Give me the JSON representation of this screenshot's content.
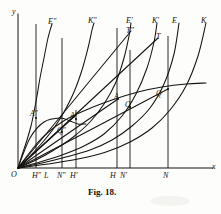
{
  "figure": {
    "caption": "Fig. 18.",
    "axes": {
      "y_label": "y",
      "x_label": "x",
      "origin_label": "O"
    },
    "curve_labels": [
      {
        "text": "E″",
        "x": 48,
        "y": 18
      },
      {
        "text": "K″",
        "x": 88,
        "y": 17
      },
      {
        "text": "E′",
        "x": 126,
        "y": 17
      },
      {
        "text": "T″",
        "x": 126,
        "y": 27
      },
      {
        "text": "K′",
        "x": 152,
        "y": 17
      },
      {
        "text": "E",
        "x": 172,
        "y": 17
      },
      {
        "text": "T",
        "x": 156,
        "y": 33
      },
      {
        "text": "K",
        "x": 201,
        "y": 17
      }
    ],
    "point_labels": [
      {
        "text": "A″",
        "x": 30,
        "y": 110
      },
      {
        "text": "Q″",
        "x": 57,
        "y": 127
      },
      {
        "text": "A′",
        "x": 70,
        "y": 112
      },
      {
        "text": "A",
        "x": 114,
        "y": 93
      },
      {
        "text": "Q′",
        "x": 125,
        "y": 101
      },
      {
        "text": "Q",
        "x": 156,
        "y": 90
      }
    ],
    "foot_labels": [
      {
        "text": "H″",
        "x": 32,
        "y": 172
      },
      {
        "text": "L",
        "x": 44,
        "y": 172
      },
      {
        "text": "N″",
        "x": 57,
        "y": 172
      },
      {
        "text": "H′",
        "x": 70,
        "y": 172
      },
      {
        "text": "H",
        "x": 110,
        "y": 172
      },
      {
        "text": "N′",
        "x": 120,
        "y": 172
      },
      {
        "text": "N",
        "x": 163,
        "y": 172
      }
    ],
    "colors": {
      "ink": "#15130f",
      "paper": "#fdfdfb"
    }
  },
  "chart_data": {
    "type": "line",
    "title": "Fig. 18.",
    "xlabel": "x",
    "ylabel": "y",
    "grid": false,
    "legend": "inline-curve-labels",
    "axis_origin_label": "O",
    "xlim": [
      0,
      221
    ],
    "ylim": [
      0,
      170
    ],
    "axes_geometry": {
      "origin": [
        18,
        168
      ],
      "x_axis_end": [
        213,
        168
      ],
      "y_axis_top": [
        18,
        14
      ]
    },
    "ordinates": [
      {
        "name": "H″",
        "x": 36,
        "y_top": 24
      },
      {
        "name": "N″",
        "x": 62,
        "y_top": 38
      },
      {
        "name": "H′",
        "x": 76,
        "y_top": 110
      },
      {
        "name": "H",
        "x": 117,
        "y_top": 28
      },
      {
        "name": "N′",
        "x": 130,
        "y_top": 50
      },
      {
        "name": "N",
        "x": 168,
        "y_top": 36
      }
    ],
    "series": [
      {
        "name": "E″",
        "kind": "total-curve",
        "points": [
          [
            18,
            168
          ],
          [
            22,
            155
          ],
          [
            27,
            140
          ],
          [
            31,
            126
          ],
          [
            34,
            112
          ],
          [
            37,
            96
          ],
          [
            40,
            78
          ],
          [
            44,
            58
          ],
          [
            48,
            38
          ],
          [
            52,
            24
          ]
        ]
      },
      {
        "name": "K″",
        "kind": "total-curve",
        "points": [
          [
            18,
            168
          ],
          [
            30,
            156
          ],
          [
            42,
            143
          ],
          [
            54,
            128
          ],
          [
            64,
            112
          ],
          [
            74,
            92
          ],
          [
            82,
            70
          ],
          [
            88,
            48
          ],
          [
            92,
            30
          ],
          [
            94,
            23
          ]
        ]
      },
      {
        "name": "E′",
        "kind": "total-curve",
        "points": [
          [
            18,
            168
          ],
          [
            36,
            160
          ],
          [
            54,
            150
          ],
          [
            72,
            138
          ],
          [
            90,
            122
          ],
          [
            104,
            104
          ],
          [
            116,
            82
          ],
          [
            124,
            58
          ],
          [
            129,
            36
          ],
          [
            131,
            23
          ]
        ]
      },
      {
        "name": "K′",
        "kind": "total-curve",
        "points": [
          [
            18,
            168
          ],
          [
            40,
            162
          ],
          [
            62,
            155
          ],
          [
            84,
            146
          ],
          [
            104,
            134
          ],
          [
            122,
            116
          ],
          [
            136,
            94
          ],
          [
            147,
            68
          ],
          [
            154,
            42
          ],
          [
            157,
            23
          ]
        ]
      },
      {
        "name": "E",
        "kind": "total-curve",
        "points": [
          [
            18,
            168
          ],
          [
            42,
            163
          ],
          [
            66,
            157
          ],
          [
            90,
            150
          ],
          [
            112,
            140
          ],
          [
            132,
            126
          ],
          [
            150,
            108
          ],
          [
            164,
            84
          ],
          [
            174,
            54
          ],
          [
            179,
            23
          ]
        ]
      },
      {
        "name": "K",
        "kind": "total-curve",
        "points": [
          [
            18,
            168
          ],
          [
            48,
            164
          ],
          [
            78,
            159
          ],
          [
            106,
            152
          ],
          [
            130,
            142
          ],
          [
            152,
            128
          ],
          [
            170,
            110
          ],
          [
            186,
            86
          ],
          [
            198,
            56
          ],
          [
            206,
            23
          ]
        ]
      },
      {
        "name": "T″",
        "kind": "secant-line",
        "points": [
          [
            18,
            168
          ],
          [
            131,
            31
          ]
        ]
      },
      {
        "name": "T",
        "kind": "secant-line",
        "points": [
          [
            18,
            168
          ],
          [
            158,
            38
          ]
        ]
      },
      {
        "name": "envelope",
        "kind": "flat-top-curve",
        "points": [
          [
            18,
            168
          ],
          [
            40,
            140
          ],
          [
            62,
            122
          ],
          [
            86,
            110
          ],
          [
            112,
            100
          ],
          [
            138,
            92
          ],
          [
            162,
            87
          ],
          [
            186,
            84
          ],
          [
            206,
            83
          ]
        ]
      },
      {
        "name": "lower-arc",
        "kind": "arc",
        "points": [
          [
            18,
            168
          ],
          [
            30,
            138
          ],
          [
            44,
            122
          ],
          [
            60,
            118
          ],
          [
            70,
            121
          ],
          [
            78,
            124
          ],
          [
            86,
            124
          ]
        ]
      },
      {
        "name": "chord-OA",
        "kind": "ray",
        "points": [
          [
            18,
            168
          ],
          [
            118,
            99
          ]
        ]
      },
      {
        "name": "chord-OQ",
        "kind": "ray",
        "points": [
          [
            18,
            168
          ],
          [
            168,
            89
          ]
        ]
      },
      {
        "name": "chord-OA2",
        "kind": "ray",
        "points": [
          [
            18,
            168
          ],
          [
            76,
            115
          ]
        ]
      }
    ],
    "annotated_points": [
      {
        "label": "A″",
        "x": 36,
        "y": 118
      },
      {
        "label": "Q″",
        "x": 62,
        "y": 132
      },
      {
        "label": "A′",
        "x": 76,
        "y": 119
      },
      {
        "label": "A",
        "x": 118,
        "y": 99
      },
      {
        "label": "Q′",
        "x": 130,
        "y": 107
      },
      {
        "label": "Q",
        "x": 168,
        "y": 89
      }
    ]
  }
}
